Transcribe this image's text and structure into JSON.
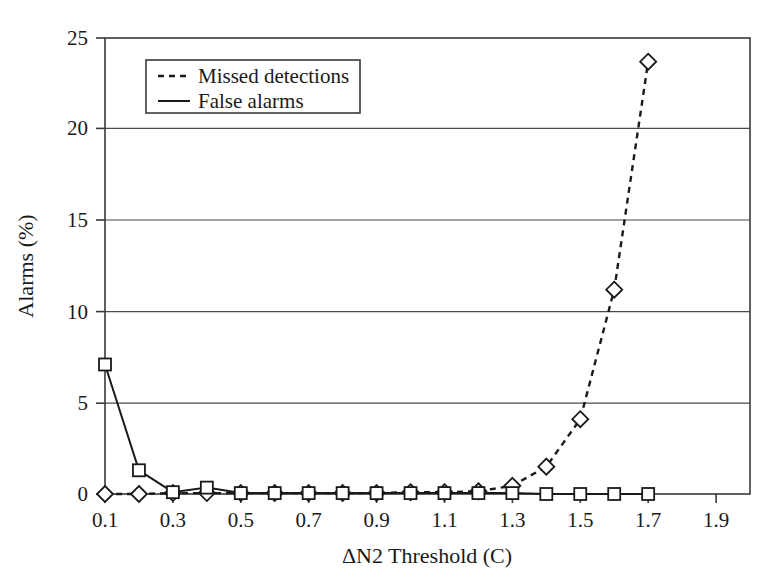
{
  "chart_data": {
    "type": "line",
    "title": "",
    "xlabel": "ΔN2 Threshold (C)",
    "ylabel": "Alarms (%)",
    "xlim": [
      0.1,
      2.0
    ],
    "ylim": [
      0,
      25
    ],
    "xticks": [
      0.1,
      0.3,
      0.5,
      0.7,
      0.9,
      1.1,
      1.3,
      1.5,
      1.7,
      1.9
    ],
    "xticklabels": [
      "0.1",
      "0.3",
      "0.5",
      "0.7",
      "0.9",
      "1.1",
      "1.3",
      "1.5",
      "1.7",
      "1.9"
    ],
    "yticks": [
      0,
      5,
      10,
      15,
      20,
      25
    ],
    "yticklabels": [
      "0",
      "5",
      "10",
      "15",
      "20",
      "25"
    ],
    "grid": "horizontal",
    "legend_position": "upper-left-inside",
    "x": [
      0.1,
      0.2,
      0.3,
      0.4,
      0.5,
      0.6,
      0.7,
      0.8,
      0.9,
      1.0,
      1.1,
      1.2,
      1.3,
      1.4,
      1.5,
      1.6,
      1.7
    ],
    "series": [
      {
        "name": "Missed detections",
        "marker": "diamond",
        "linestyle": "dashed",
        "color": "#1a1a1a",
        "values": [
          0,
          0,
          0.05,
          0.05,
          0.05,
          0.05,
          0.05,
          0.05,
          0.05,
          0.1,
          0.1,
          0.15,
          0.45,
          1.5,
          4.1,
          11.2,
          23.7
        ]
      },
      {
        "name": "False alarms",
        "marker": "square",
        "linestyle": "solid",
        "color": "#1a1a1a",
        "values": [
          7.1,
          1.3,
          0.1,
          0.35,
          0.05,
          0.05,
          0.05,
          0.05,
          0.05,
          0.05,
          0.05,
          0.05,
          0.05,
          0.0,
          0.0,
          0.0,
          0.0
        ]
      }
    ]
  },
  "legend": {
    "entries": [
      {
        "label": "Missed detections",
        "style": "dashed"
      },
      {
        "label": "False alarms",
        "style": "solid"
      }
    ]
  },
  "axes": {
    "y_title": "Alarms (%)",
    "x_title": "ΔN2 Threshold (C)"
  }
}
